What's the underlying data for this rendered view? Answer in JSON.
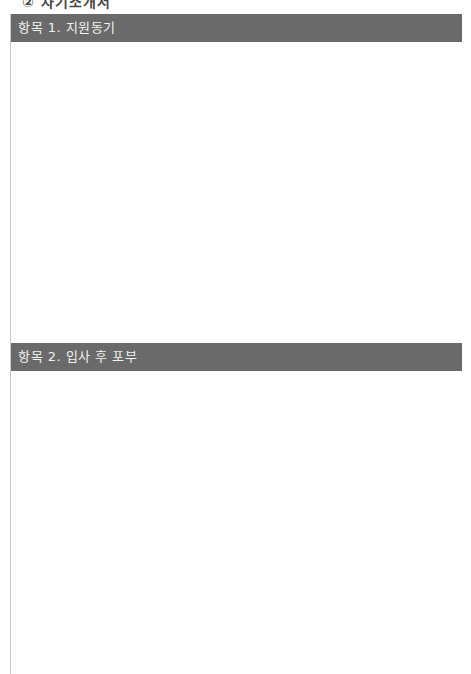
{
  "document": {
    "clipped_heading": "② 자기소개서",
    "sections": [
      {
        "title": "항목 1. 지원동기",
        "answer": ""
      },
      {
        "title": "항목 2. 입사 후 포부",
        "answer": ""
      }
    ],
    "colors": {
      "section_bar_bg": "#6a6a6a",
      "section_bar_text": "#f2f2f2",
      "border": "#c8c8c8"
    }
  }
}
